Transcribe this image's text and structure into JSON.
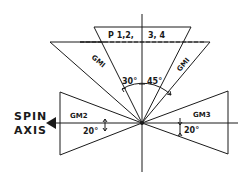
{
  "diagram": {
    "labels": {
      "p_left": "P 1,2,",
      "p_right": "3, 4",
      "gm1_left": "GMI",
      "gm1_right": "GMI",
      "gm2": "GM2",
      "gm3": "GM3",
      "spin_line1": "SPIN",
      "spin_line2": "AXIS",
      "angle_30": "30°",
      "angle_45": "45°",
      "angle_20_left": "20°",
      "angle_20_right": "20°"
    },
    "colors": {
      "stroke": "#1a1a1a",
      "background": "#ffffff"
    }
  }
}
